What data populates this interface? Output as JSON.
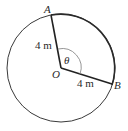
{
  "diagram": {
    "type": "circle-sector",
    "colors": {
      "circle": "#3a3a3a",
      "radius_lines": "#222222",
      "angle_arc": "#8a8a8a",
      "text": "#2a2a2a",
      "background": "#ffffff"
    },
    "center": {
      "label": "O"
    },
    "points": [
      {
        "label": "A"
      },
      {
        "label": "B"
      }
    ],
    "radius_labels": [
      {
        "segment": "OA",
        "text": "4 m"
      },
      {
        "segment": "OB",
        "text": "4 m"
      }
    ],
    "angle": {
      "label": "θ",
      "between": "OA and OB"
    }
  }
}
